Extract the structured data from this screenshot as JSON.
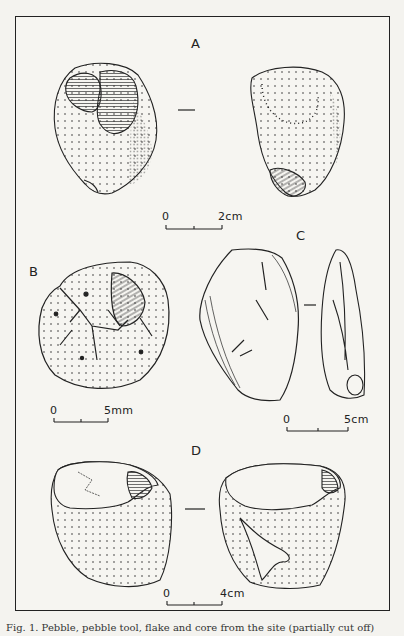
{
  "figure": {
    "panels": [
      {
        "id": "A",
        "label": "A",
        "scale": {
          "zero": "0",
          "end": "2cm"
        }
      },
      {
        "id": "B",
        "label": "B",
        "scale": {
          "zero": "0",
          "end": "5mm"
        }
      },
      {
        "id": "C",
        "label": "C",
        "scale": {
          "zero": "0",
          "end": "5cm"
        }
      },
      {
        "id": "D",
        "label": "D",
        "scale": {
          "zero": "0",
          "end": "4cm"
        }
      }
    ],
    "caption": "Fig. 1. Pebble, pebble tool, flake and core from the site (partially cut off)"
  }
}
